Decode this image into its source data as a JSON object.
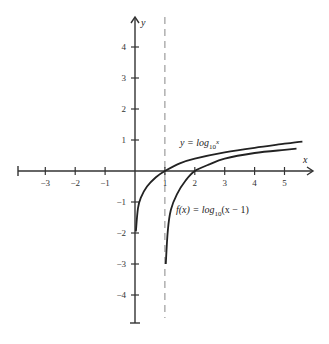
{
  "chart_data": {
    "type": "line",
    "title": "",
    "xlabel": "x",
    "ylabel": "y",
    "xlim": [
      -4,
      5.8
    ],
    "ylim": [
      -5,
      5
    ],
    "grid": false,
    "x_ticks": [
      -3,
      -2,
      -1,
      1,
      2,
      3,
      4,
      5
    ],
    "y_ticks": [
      4,
      3,
      2,
      1,
      -1,
      -2,
      -3,
      -4
    ],
    "x_tick_labels": [
      "−3",
      "−2",
      "−1",
      "1",
      "2",
      "3",
      "4",
      "5"
    ],
    "y_tick_labels": [
      "4",
      "3",
      "2",
      "1",
      "−1",
      "−2",
      "−3",
      "−4"
    ],
    "asymptote": {
      "type": "vertical",
      "x": 1,
      "style": "dashed"
    },
    "series": [
      {
        "name": "y = log10 x",
        "x": [
          0.03,
          0.1,
          0.2,
          0.4,
          0.7,
          1,
          1.5,
          2,
          3,
          4,
          5,
          5.6
        ],
        "y": [
          -1.95,
          -1.2,
          -0.85,
          -0.5,
          -0.2,
          0,
          0.25,
          0.4,
          0.6,
          0.75,
          0.88,
          0.95
        ]
      },
      {
        "name": "f(x) = log10(x − 1)",
        "x": [
          1.03,
          1.1,
          1.2,
          1.4,
          1.7,
          2,
          2.5,
          3,
          4,
          5,
          5.4
        ],
        "y": [
          -3.0,
          -1.9,
          -1.25,
          -0.75,
          -0.3,
          0,
          0.22,
          0.4,
          0.58,
          0.68,
          0.72
        ]
      }
    ],
    "annotations": [
      {
        "text_main": "y = log",
        "text_sub": "10",
        "text_sup": "x",
        "at": [
          3.1,
          1.0
        ]
      },
      {
        "text_main": "f(x) = log",
        "text_sub": "10",
        "text_tail": "(x − 1)",
        "at": [
          2.0,
          -1.3
        ]
      }
    ]
  }
}
